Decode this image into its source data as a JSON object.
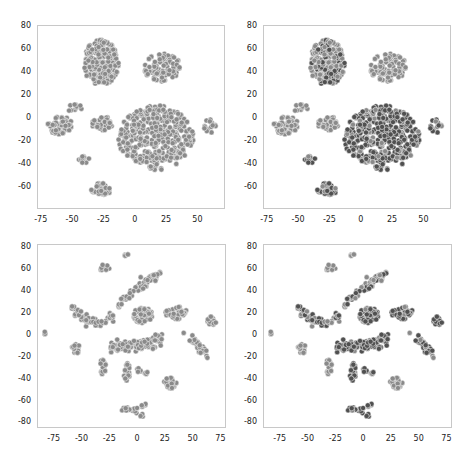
{
  "figure": {
    "width": 471,
    "height": 460
  },
  "colors": {
    "light_dot": "#8a8a8a",
    "dark_dot": "#505050",
    "dot_edge": "#ffffff",
    "frame": "#c8c8c8"
  },
  "chart_data": [
    {
      "type": "scatter",
      "panel": "top-left",
      "title": "",
      "xlabel": "",
      "ylabel": "",
      "xlim": [
        -78,
        72
      ],
      "ylim": [
        -80,
        80
      ],
      "xticks": [
        -75,
        -50,
        -25,
        0,
        25,
        50
      ],
      "yticks": [
        -60,
        -40,
        -20,
        0,
        20,
        40,
        60,
        80
      ],
      "grid": false,
      "shading": "uniform gray",
      "clusters": [
        {
          "name": "A",
          "cx": -27,
          "cy": 47,
          "rx": 14,
          "ry": 20,
          "n": 230,
          "shade": "light"
        },
        {
          "name": "B",
          "cx": 22,
          "cy": 43,
          "rx": 15,
          "ry": 12,
          "n": 90,
          "shade": "light"
        },
        {
          "name": "C",
          "cx": -60,
          "cy": -7,
          "rx": 10,
          "ry": 8,
          "n": 60,
          "shade": "light"
        },
        {
          "name": "D",
          "cx": -25,
          "cy": -6,
          "rx": 10,
          "ry": 6,
          "n": 35,
          "shade": "light"
        },
        {
          "name": "E",
          "cx": 17,
          "cy": -18,
          "rx": 30,
          "ry": 28,
          "n": 380,
          "shade": "light"
        },
        {
          "name": "F",
          "cx": 60,
          "cy": -8,
          "rx": 5,
          "ry": 6,
          "n": 15,
          "shade": "light"
        },
        {
          "name": "G",
          "cx": -27,
          "cy": -63,
          "rx": 8,
          "ry": 6,
          "n": 45,
          "shade": "light"
        },
        {
          "name": "H",
          "cx": -40,
          "cy": -37,
          "rx": 5,
          "ry": 3,
          "n": 10,
          "shade": "light"
        },
        {
          "name": "I",
          "cx": -48,
          "cy": 8,
          "rx": 6,
          "ry": 4,
          "n": 10,
          "shade": "light"
        }
      ]
    },
    {
      "type": "scatter",
      "panel": "top-right",
      "title": "",
      "xlabel": "",
      "ylabel": "",
      "xlim": [
        -78,
        72
      ],
      "ylim": [
        -80,
        80
      ],
      "xticks": [
        -75,
        -50,
        -25,
        0,
        25,
        50
      ],
      "yticks": [
        -60,
        -40,
        -20,
        0,
        20,
        40,
        60,
        80
      ],
      "grid": false,
      "shading": "mixed gray levels",
      "clusters": [
        {
          "name": "A",
          "cx": -27,
          "cy": 47,
          "rx": 14,
          "ry": 20,
          "n": 230,
          "shade": "mixed"
        },
        {
          "name": "B",
          "cx": 22,
          "cy": 43,
          "rx": 15,
          "ry": 12,
          "n": 90,
          "shade": "light"
        },
        {
          "name": "C",
          "cx": -60,
          "cy": -7,
          "rx": 10,
          "ry": 8,
          "n": 60,
          "shade": "light"
        },
        {
          "name": "D",
          "cx": -25,
          "cy": -6,
          "rx": 10,
          "ry": 6,
          "n": 35,
          "shade": "light"
        },
        {
          "name": "E",
          "cx": 17,
          "cy": -18,
          "rx": 30,
          "ry": 28,
          "n": 380,
          "shade": "dark"
        },
        {
          "name": "F",
          "cx": 60,
          "cy": -8,
          "rx": 5,
          "ry": 6,
          "n": 15,
          "shade": "mixed"
        },
        {
          "name": "G",
          "cx": -27,
          "cy": -63,
          "rx": 8,
          "ry": 6,
          "n": 45,
          "shade": "dark"
        },
        {
          "name": "H",
          "cx": -40,
          "cy": -37,
          "rx": 5,
          "ry": 3,
          "n": 10,
          "shade": "dark"
        },
        {
          "name": "I",
          "cx": -48,
          "cy": 8,
          "rx": 6,
          "ry": 4,
          "n": 10,
          "shade": "light"
        }
      ]
    },
    {
      "type": "scatter",
      "panel": "bottom-left",
      "title": "",
      "xlabel": "",
      "ylabel": "",
      "xlim": [
        -90,
        80
      ],
      "ylim": [
        -86,
        82
      ],
      "xticks": [
        -75,
        -50,
        -25,
        0,
        25,
        50,
        75
      ],
      "yticks": [
        -80,
        -60,
        -40,
        -20,
        0,
        20,
        40,
        60,
        80
      ],
      "grid": false,
      "shading": "uniform gray",
      "clusters": [
        {
          "name": "a",
          "cx": -83,
          "cy": 1,
          "rx": 2,
          "ry": 2,
          "n": 4,
          "shade": "light"
        },
        {
          "name": "b",
          "cx": -55,
          "cy": -13,
          "rx": 4,
          "ry": 5,
          "n": 14,
          "shade": "light"
        },
        {
          "name": "c",
          "cx": -30,
          "cy": 60,
          "rx": 5,
          "ry": 3,
          "n": 10,
          "shade": "light"
        },
        {
          "name": "d",
          "cx": -10,
          "cy": 72,
          "rx": 2,
          "ry": 3,
          "n": 6,
          "shade": "light"
        },
        {
          "name": "arc",
          "path": [
            [
              -60,
              28
            ],
            [
              -50,
              15
            ],
            [
              -38,
              10
            ],
            [
              -28,
              12
            ],
            [
              -20,
              20
            ],
            [
              -12,
              32
            ],
            [
              0,
              42
            ],
            [
              10,
              50
            ],
            [
              20,
              55
            ]
          ],
          "spread": 3,
          "n": 110,
          "shade": "light"
        },
        {
          "name": "e",
          "cx": 5,
          "cy": 17,
          "rx": 9,
          "ry": 7,
          "n": 55,
          "shade": "light"
        },
        {
          "name": "f",
          "cx": 35,
          "cy": 19,
          "rx": 10,
          "ry": 6,
          "n": 40,
          "shade": "light"
        },
        {
          "name": "g",
          "cx": 67,
          "cy": 11,
          "rx": 4,
          "ry": 5,
          "n": 16,
          "shade": "light"
        },
        {
          "name": "h",
          "path": [
            [
              -22,
              -12
            ],
            [
              -5,
              -10
            ],
            [
              10,
              -10
            ],
            [
              20,
              -5
            ]
          ],
          "spread": 5,
          "n": 90,
          "shade": "light"
        },
        {
          "name": "i",
          "path": [
            [
              45,
              3
            ],
            [
              52,
              -8
            ],
            [
              58,
              -15
            ],
            [
              64,
              -20
            ]
          ],
          "spread": 3,
          "n": 30,
          "shade": "light"
        },
        {
          "name": "j",
          "cx": -31,
          "cy": -30,
          "rx": 3,
          "ry": 7,
          "n": 16,
          "shade": "light"
        },
        {
          "name": "k",
          "cx": -9,
          "cy": -35,
          "rx": 3,
          "ry": 8,
          "n": 18,
          "shade": "light"
        },
        {
          "name": "l",
          "path": [
            [
              0,
              -32
            ],
            [
              10,
              -38
            ]
          ],
          "spread": 1.5,
          "n": 8,
          "shade": "light"
        },
        {
          "name": "m",
          "cx": 30,
          "cy": -45,
          "rx": 6,
          "ry": 5,
          "n": 28,
          "shade": "light"
        },
        {
          "name": "n",
          "path": [
            [
              -12,
              -68
            ],
            [
              -2,
              -70
            ],
            [
              8,
              -64
            ]
          ],
          "spread": 2.5,
          "n": 20,
          "shade": "light"
        },
        {
          "name": "o",
          "cx": 5,
          "cy": -75,
          "rx": 2,
          "ry": 2,
          "n": 5,
          "shade": "light"
        }
      ]
    },
    {
      "type": "scatter",
      "panel": "bottom-right",
      "title": "",
      "xlabel": "",
      "ylabel": "",
      "xlim": [
        -90,
        80
      ],
      "ylim": [
        -86,
        82
      ],
      "xticks": [
        -75,
        -50,
        -25,
        0,
        25,
        50,
        75
      ],
      "yticks": [
        -80,
        -60,
        -40,
        -20,
        0,
        20,
        40,
        60,
        80
      ],
      "grid": false,
      "shading": "mixed gray levels",
      "clusters": [
        {
          "name": "a",
          "cx": -83,
          "cy": 1,
          "rx": 2,
          "ry": 2,
          "n": 4,
          "shade": "light"
        },
        {
          "name": "b",
          "cx": -55,
          "cy": -13,
          "rx": 4,
          "ry": 5,
          "n": 14,
          "shade": "light"
        },
        {
          "name": "c",
          "cx": -30,
          "cy": 60,
          "rx": 5,
          "ry": 3,
          "n": 10,
          "shade": "light"
        },
        {
          "name": "d",
          "cx": -10,
          "cy": 72,
          "rx": 2,
          "ry": 3,
          "n": 6,
          "shade": "light"
        },
        {
          "name": "arc",
          "path": [
            [
              -60,
              28
            ],
            [
              -50,
              15
            ],
            [
              -38,
              10
            ],
            [
              -28,
              12
            ],
            [
              -20,
              20
            ],
            [
              -12,
              32
            ],
            [
              0,
              42
            ],
            [
              10,
              50
            ],
            [
              20,
              55
            ]
          ],
          "spread": 3,
          "n": 110,
          "shade": "mixed"
        },
        {
          "name": "e",
          "cx": 5,
          "cy": 17,
          "rx": 9,
          "ry": 7,
          "n": 55,
          "shade": "dark"
        },
        {
          "name": "f",
          "cx": 35,
          "cy": 19,
          "rx": 10,
          "ry": 6,
          "n": 40,
          "shade": "dark"
        },
        {
          "name": "g",
          "cx": 67,
          "cy": 11,
          "rx": 4,
          "ry": 5,
          "n": 16,
          "shade": "dark"
        },
        {
          "name": "h",
          "path": [
            [
              -22,
              -12
            ],
            [
              -5,
              -10
            ],
            [
              10,
              -10
            ],
            [
              20,
              -5
            ]
          ],
          "spread": 5,
          "n": 90,
          "shade": "dark"
        },
        {
          "name": "i",
          "path": [
            [
              45,
              3
            ],
            [
              52,
              -8
            ],
            [
              58,
              -15
            ],
            [
              64,
              -20
            ]
          ],
          "spread": 3,
          "n": 30,
          "shade": "dark"
        },
        {
          "name": "j",
          "cx": -31,
          "cy": -30,
          "rx": 3,
          "ry": 7,
          "n": 16,
          "shade": "light"
        },
        {
          "name": "k",
          "cx": -9,
          "cy": -35,
          "rx": 3,
          "ry": 8,
          "n": 18,
          "shade": "dark"
        },
        {
          "name": "l",
          "path": [
            [
              0,
              -32
            ],
            [
              10,
              -38
            ]
          ],
          "spread": 1.5,
          "n": 8,
          "shade": "dark"
        },
        {
          "name": "m",
          "cx": 30,
          "cy": -45,
          "rx": 6,
          "ry": 5,
          "n": 28,
          "shade": "light"
        },
        {
          "name": "n",
          "path": [
            [
              -12,
              -68
            ],
            [
              -2,
              -70
            ],
            [
              8,
              -64
            ]
          ],
          "spread": 2.5,
          "n": 20,
          "shade": "dark"
        },
        {
          "name": "o",
          "cx": 5,
          "cy": -75,
          "rx": 2,
          "ry": 2,
          "n": 5,
          "shade": "dark"
        }
      ]
    }
  ],
  "layout": {
    "panels": [
      {
        "id": "top-left",
        "left": 37,
        "top": 25,
        "width": 188,
        "height": 184
      },
      {
        "id": "top-right",
        "left": 263,
        "top": 25,
        "width": 188,
        "height": 184
      },
      {
        "id": "bottom-left",
        "left": 37,
        "top": 244,
        "width": 189,
        "height": 184
      },
      {
        "id": "bottom-right",
        "left": 263,
        "top": 244,
        "width": 189,
        "height": 184
      }
    ]
  }
}
